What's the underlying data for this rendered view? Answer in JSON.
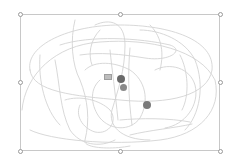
{
  "canvas": {
    "background": "#ffffff",
    "stroke_color": "#d2d2d2",
    "selection_border_color": "#c8c8c8",
    "handle_color": "#9a9a9a"
  },
  "selection": {
    "box": {
      "x": 20,
      "y": 14,
      "w": 200,
      "h": 137
    },
    "handles": [
      {
        "id": "top-left",
        "x": 20,
        "y": 14
      },
      {
        "id": "top-middle",
        "x": 120,
        "y": 14
      },
      {
        "id": "top-right",
        "x": 220,
        "y": 14
      },
      {
        "id": "middle-left",
        "x": 20,
        "y": 82
      },
      {
        "id": "middle-right",
        "x": 220,
        "y": 82
      },
      {
        "id": "bottom-left",
        "x": 20,
        "y": 151
      },
      {
        "id": "bottom-middle",
        "x": 120,
        "y": 151
      },
      {
        "id": "bottom-right",
        "x": 220,
        "y": 151
      }
    ]
  },
  "markers": {
    "square": {
      "x": 105,
      "y": 75,
      "color": "#bdbdbd"
    },
    "dots": [
      {
        "id": "dot-1",
        "x": 121,
        "y": 79,
        "r": 4,
        "color": "#6e6e6e"
      },
      {
        "id": "dot-2",
        "x": 123,
        "y": 87,
        "r": 3.5,
        "color": "#8a8a8a"
      },
      {
        "id": "dot-3",
        "x": 147,
        "y": 105,
        "r": 4,
        "color": "#7a7a7a"
      }
    ]
  }
}
